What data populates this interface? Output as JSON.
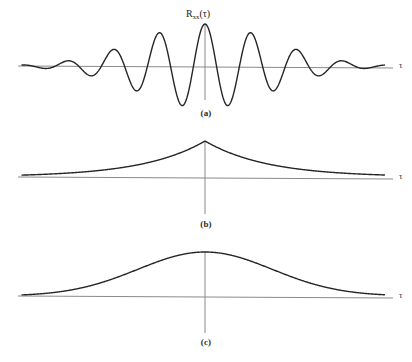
{
  "figure": {
    "title_label": "R",
    "background": "#ffffff",
    "curve_color": "#262626",
    "axis_color": "#8a8a8a",
    "tau_symbol": "τ"
  },
  "labels": {
    "main_function_base": "R",
    "main_function_sub": "xx",
    "main_function_arg": "(τ)",
    "axis_tau": "τ",
    "caption_a": "(a)",
    "caption_b": "(b)",
    "caption_c": "(c)",
    "bottom_fragment": ""
  },
  "chart_data": [
    {
      "id": "panel-a",
      "type": "line",
      "title": "R_xx(τ)",
      "xlabel": "τ",
      "ylabel": "",
      "description": "Damped oscillatory autocorrelation function: cosine modulated by a Gaussian/exponential envelope, symmetric about τ = 0",
      "function": "exp(-(x/k)^2) * cos(2*pi*x/T)",
      "envelope_scale_px": 95,
      "period_px": 46,
      "amplitude_px": 42,
      "baseline_y_px": 66,
      "center_x_px": 205,
      "axis_x_start_px": 18,
      "axis_x_end_px": 393,
      "vline_top_px": 24,
      "vline_bottom_px": 100,
      "x": [
        -187,
        -160,
        -137,
        -114,
        -92,
        -69,
        -46,
        -23,
        0,
        23,
        46,
        69,
        92,
        114,
        137,
        160,
        187
      ],
      "y": [
        0.0,
        -0.04,
        0.08,
        -0.16,
        0.3,
        -0.52,
        0.67,
        -0.85,
        1.0,
        -0.85,
        0.67,
        -0.52,
        0.3,
        -0.16,
        0.08,
        -0.04,
        0.0
      ],
      "grid": false,
      "legend": false
    },
    {
      "id": "panel-b",
      "type": "line",
      "title": "",
      "xlabel": "τ",
      "ylabel": "",
      "description": "Two-sided exponential autocorrelation with a sharp cusp peak at τ = 0",
      "function": "exp(-|x|/k)",
      "decay_scale_px": 62,
      "amplitude_px": 36,
      "baseline_y_px": 177,
      "center_x_px": 205,
      "axis_x_start_px": 18,
      "axis_x_end_px": 393,
      "vline_top_px": 141,
      "vline_bottom_px": 214,
      "x": [
        -187,
        -150,
        -120,
        -90,
        -60,
        -30,
        0,
        30,
        60,
        90,
        120,
        150,
        187
      ],
      "y": [
        0.05,
        0.09,
        0.14,
        0.23,
        0.38,
        0.62,
        1.0,
        0.62,
        0.38,
        0.23,
        0.14,
        0.09,
        0.05
      ],
      "grid": false,
      "legend": false
    },
    {
      "id": "panel-c",
      "type": "line",
      "title": "",
      "xlabel": "τ",
      "ylabel": "",
      "description": "Gaussian-shaped autocorrelation, broad smooth rounded peak at τ = 0",
      "function": "exp(-(x/k)^2)",
      "width_scale_px": 95,
      "amplitude_px": 44,
      "baseline_y_px": 296,
      "center_x_px": 205,
      "axis_x_start_px": 18,
      "axis_x_end_px": 393,
      "vline_top_px": 252,
      "vline_bottom_px": 333,
      "x": [
        -187,
        -160,
        -130,
        -100,
        -70,
        -40,
        0,
        40,
        70,
        100,
        130,
        160,
        187
      ],
      "y": [
        0.02,
        0.06,
        0.16,
        0.33,
        0.6,
        0.85,
        1.0,
        0.85,
        0.6,
        0.33,
        0.16,
        0.06,
        0.02
      ],
      "grid": false,
      "legend": false
    }
  ],
  "positions": {
    "caption_a": {
      "left": 186,
      "top": 108
    },
    "caption_b": {
      "left": 186,
      "top": 219
    },
    "caption_c": {
      "left": 186,
      "top": 337
    },
    "curve_label": {
      "left": 186,
      "top": 8
    },
    "tau_a": {
      "left": 399,
      "top": 60
    },
    "tau_b": {
      "left": 399,
      "top": 171
    },
    "tau_c": {
      "left": 399,
      "top": 290
    }
  }
}
